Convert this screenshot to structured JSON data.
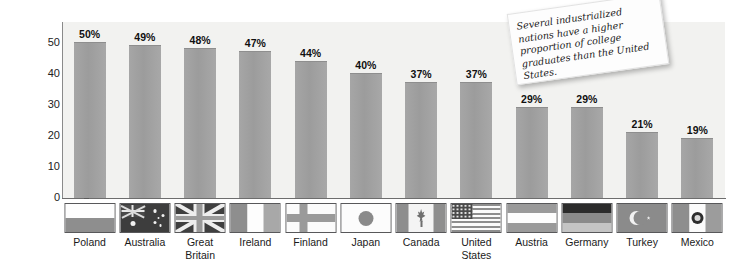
{
  "chart_data": {
    "type": "bar",
    "title": "",
    "xlabel": "",
    "ylabel": "Percent",
    "ylim": [
      0,
      50
    ],
    "yticks": [
      0,
      10,
      20,
      30,
      40,
      50
    ],
    "grid": false,
    "legend": null,
    "categories": [
      "Poland",
      "Australia",
      "Great Britain",
      "Ireland",
      "Finland",
      "Japan",
      "Canada",
      "United States",
      "Austria",
      "Germany",
      "Turkey",
      "Mexico"
    ],
    "values": [
      50,
      49,
      48,
      47,
      44,
      40,
      37,
      37,
      29,
      29,
      21,
      19
    ],
    "value_labels": [
      "50%",
      "49%",
      "48%",
      "47%",
      "44%",
      "40%",
      "37%",
      "37%",
      "29%",
      "29%",
      "21%",
      "19%"
    ],
    "annotations": [
      "Several industrialized nations have a higher proportion of college graduates than the United States."
    ],
    "bar_color": "#9c9c9c",
    "plot_background": "#f2f2f0"
  },
  "axis": {
    "y_title": "Percent",
    "y_ticks": [
      "50",
      "40",
      "30",
      "20",
      "10",
      "0"
    ]
  },
  "note": {
    "text": "Several industrialized nations have a higher proportion of college graduates than the United States."
  },
  "countries": [
    {
      "name": "Poland",
      "name_line1": "Poland",
      "name_line2": "",
      "value": 50,
      "label": "50%",
      "flag": "flag-poland"
    },
    {
      "name": "Australia",
      "name_line1": "Australia",
      "name_line2": "",
      "value": 49,
      "label": "49%",
      "flag": "flag-australia"
    },
    {
      "name": "Great Britain",
      "name_line1": "Great",
      "name_line2": "Britain",
      "value": 48,
      "label": "48%",
      "flag": "flag-great-britain"
    },
    {
      "name": "Ireland",
      "name_line1": "Ireland",
      "name_line2": "",
      "value": 47,
      "label": "47%",
      "flag": "flag-ireland"
    },
    {
      "name": "Finland",
      "name_line1": "Finland",
      "name_line2": "",
      "value": 44,
      "label": "44%",
      "flag": "flag-finland"
    },
    {
      "name": "Japan",
      "name_line1": "Japan",
      "name_line2": "",
      "value": 40,
      "label": "40%",
      "flag": "flag-japan"
    },
    {
      "name": "Canada",
      "name_line1": "Canada",
      "name_line2": "",
      "value": 37,
      "label": "37%",
      "flag": "flag-canada"
    },
    {
      "name": "United States",
      "name_line1": "United",
      "name_line2": "States",
      "value": 37,
      "label": "37%",
      "flag": "flag-united-states"
    },
    {
      "name": "Austria",
      "name_line1": "Austria",
      "name_line2": "",
      "value": 29,
      "label": "29%",
      "flag": "flag-austria"
    },
    {
      "name": "Germany",
      "name_line1": "Germany",
      "name_line2": "",
      "value": 29,
      "label": "29%",
      "flag": "flag-germany"
    },
    {
      "name": "Turkey",
      "name_line1": "Turkey",
      "name_line2": "",
      "value": 21,
      "label": "21%",
      "flag": "flag-turkey"
    },
    {
      "name": "Mexico",
      "name_line1": "Mexico",
      "name_line2": "",
      "value": 19,
      "label": "19%",
      "flag": "flag-mexico"
    }
  ]
}
